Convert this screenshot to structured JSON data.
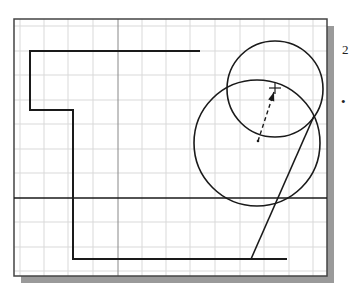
{
  "viewport": {
    "frame": {
      "x": 14,
      "y": 19,
      "width": 313,
      "height": 257
    },
    "shadow": {
      "dx": 7,
      "dy": 7,
      "color": "#9a9a9a"
    },
    "background": "#ffffff",
    "border_color": "#444444"
  },
  "grid": {
    "color": "#d9d9d9",
    "vertical_lines": [
      20,
      44,
      68,
      93,
      142,
      166,
      190,
      215,
      240,
      264,
      289,
      313
    ],
    "horizontal_lines": [
      26,
      51,
      75,
      100,
      124,
      149,
      173,
      222,
      247,
      271
    ]
  },
  "axes": {
    "color": "#888888",
    "vertical_x": 118,
    "horizontal_y": 198
  },
  "sketch": {
    "stroke_color": "#1a1a1a",
    "polyline": [
      [
        200,
        51
      ],
      [
        30,
        51
      ],
      [
        30,
        110
      ],
      [
        73,
        110
      ],
      [
        73,
        259
      ],
      [
        287,
        259
      ]
    ],
    "horizontal_line": {
      "x1": 14,
      "y1": 198,
      "x2": 327,
      "y2": 198
    },
    "slanted_line": {
      "x1": 251,
      "y1": 259,
      "x2": 314,
      "y2": 116
    },
    "circles": [
      {
        "name": "small-circle",
        "cx": 275,
        "cy": 89,
        "r": 48
      },
      {
        "name": "large-circle",
        "cx": 257,
        "cy": 143,
        "r": 63
      }
    ],
    "dashed_arrow": {
      "x1": 258,
      "y1": 141,
      "x2": 274,
      "y2": 92
    },
    "center_dot": {
      "x": 258,
      "y": 141
    },
    "cursor_crosshair": {
      "x": 275,
      "y": 88
    }
  },
  "side_labels": [
    {
      "text": "2",
      "x": 342,
      "y": 43
    },
    {
      "text": "•",
      "x": 341,
      "y": 95
    }
  ]
}
